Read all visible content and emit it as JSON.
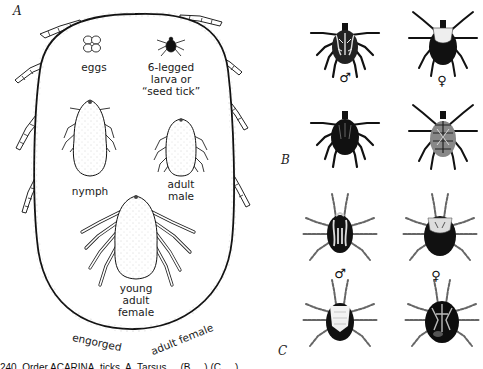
{
  "figure": {
    "panel_a": {
      "letter": "A",
      "labels": {
        "eggs": "eggs",
        "larva_line1": "6-legged",
        "larva_line2": "larva or",
        "larva_line3": "“seed tick”",
        "nymph": "nymph",
        "adult_male_line1": "adult",
        "adult_male_line2": "male",
        "young_female_line1": "young",
        "young_female_line2": "adult",
        "young_female_line3": "female",
        "engorged": "engorged",
        "adult_female": "adult female"
      }
    },
    "panel_b": {
      "letter": "B",
      "male_symbol": "♂",
      "female_symbol": "♀"
    },
    "panel_c": {
      "letter": "C",
      "male_symbol": "♂",
      "female_symbol": "♀"
    },
    "caption": "240. Order ACARINA, ticks. A, Tarsus ... (B, ...) (C, ...) ..."
  },
  "colors": {
    "ink": "#111111",
    "paper": "#ffffff",
    "stipple": "#555555"
  }
}
